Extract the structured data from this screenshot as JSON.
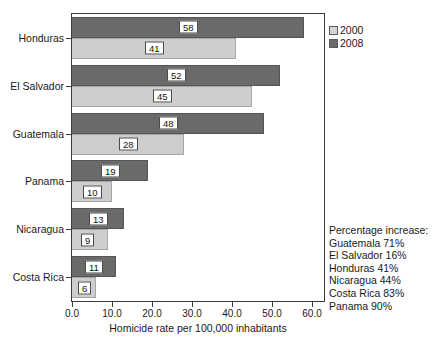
{
  "chart_data": {
    "type": "bar",
    "orientation": "horizontal",
    "title": "",
    "xlabel": "Homicide rate per 100,000 inhabitants",
    "ylabel": "",
    "xlim": [
      0,
      63
    ],
    "xticks": [
      "0.0",
      "10.0",
      "20.0",
      "30.0",
      "40.0",
      "50.0",
      "60.0"
    ],
    "xtick_values": [
      0,
      10,
      20,
      30,
      40,
      50,
      60
    ],
    "grid": false,
    "legend_position": "right-top",
    "categories": [
      "Honduras",
      "El Salvador",
      "Guatemala",
      "Panama",
      "Nicaragua",
      "Costa Rica"
    ],
    "series": [
      {
        "name": "2008",
        "color": "#6a6a6a",
        "values": [
          58,
          52,
          48,
          19,
          13,
          11
        ]
      },
      {
        "name": "2000",
        "color": "#cdcdcd",
        "values": [
          41,
          45,
          28,
          10,
          9,
          6
        ]
      }
    ],
    "annotations": [
      "Percentage increase:",
      "Guatemala 71%",
      "El Salvador 16%",
      "Honduras 41%",
      "Nicaragua 44%",
      "Costa Rica 83%",
      "Panama 90%"
    ]
  }
}
